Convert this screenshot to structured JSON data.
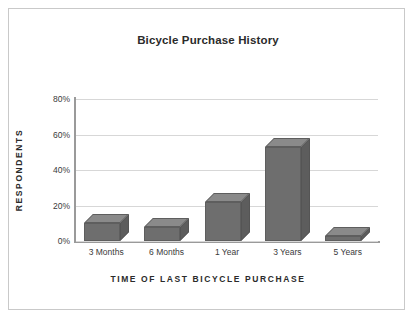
{
  "chart_data": {
    "type": "bar",
    "title": "Bicycle Purchase History",
    "xlabel": "TIME OF LAST BICYCLE PURCHASE",
    "ylabel": "RESPONDENTS",
    "categories": [
      "3 Months",
      "6 Months",
      "1 Year",
      "3 Years",
      "5 Years"
    ],
    "values": [
      10,
      8,
      22,
      53,
      3
    ],
    "value_unit": "%",
    "ylim": [
      0,
      80
    ],
    "ytick_labels": [
      "0%",
      "20%",
      "40%",
      "60%",
      "80%"
    ],
    "ytick_values": [
      0,
      20,
      40,
      60,
      80
    ],
    "grid": true,
    "legend": false,
    "style": "3d-column",
    "colors": {
      "bar_front": "#6e6e6e",
      "bar_top": "#8a8a8a",
      "bar_side": "#5d5d5d",
      "gridline": "#d7d7d7",
      "axis": "#9a9a9a",
      "text": "#2b2b2b",
      "frame": "#c9c9c9",
      "background": "#ffffff"
    }
  }
}
